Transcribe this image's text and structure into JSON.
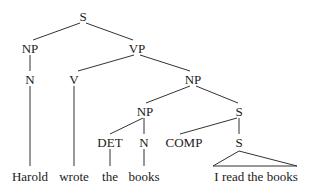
{
  "diagram": {
    "type": "syntax-tree",
    "nodes": [
      {
        "id": "s_root",
        "label": "S",
        "x": 83,
        "y": 17
      },
      {
        "id": "np1",
        "label": "NP",
        "x": 30,
        "y": 49
      },
      {
        "id": "vp",
        "label": "VP",
        "x": 137,
        "y": 49
      },
      {
        "id": "n1",
        "label": "N",
        "x": 30,
        "y": 80
      },
      {
        "id": "v",
        "label": "V",
        "x": 74,
        "y": 80
      },
      {
        "id": "np2",
        "label": "NP",
        "x": 193,
        "y": 80
      },
      {
        "id": "np3",
        "label": "NP",
        "x": 145,
        "y": 112
      },
      {
        "id": "s2",
        "label": "S",
        "x": 239,
        "y": 112
      },
      {
        "id": "det",
        "label": "DET",
        "x": 110,
        "y": 143
      },
      {
        "id": "n2",
        "label": "N",
        "x": 144,
        "y": 143
      },
      {
        "id": "comp",
        "label": "COMP",
        "x": 196,
        "y": 143
      },
      {
        "id": "s3",
        "label": "S",
        "x": 239,
        "y": 143
      }
    ],
    "leaves": [
      {
        "id": "w_harold",
        "label": "Harold",
        "x": 30,
        "y": 178
      },
      {
        "id": "w_wrote",
        "label": "wrote",
        "x": 74,
        "y": 178
      },
      {
        "id": "w_the",
        "label": "the",
        "x": 110,
        "y": 178
      },
      {
        "id": "w_books",
        "label": "books",
        "x": 144,
        "y": 178
      },
      {
        "id": "w_clause",
        "label": "I read the books",
        "x": 256,
        "y": 178
      }
    ],
    "edges": [
      [
        "s_root",
        "np1"
      ],
      [
        "s_root",
        "vp"
      ],
      [
        "np1",
        "n1"
      ],
      [
        "vp",
        "v"
      ],
      [
        "vp",
        "np2"
      ],
      [
        "np2",
        "np3"
      ],
      [
        "np2",
        "s2"
      ],
      [
        "np3",
        "det"
      ],
      [
        "np3",
        "n2"
      ],
      [
        "s2",
        "comp"
      ],
      [
        "s2",
        "s3"
      ],
      [
        "n1",
        "w_harold"
      ],
      [
        "v",
        "w_wrote"
      ],
      [
        "det",
        "w_the"
      ],
      [
        "n2",
        "w_books"
      ]
    ],
    "triangle": {
      "from": "s3",
      "apex": [
        239,
        151
      ],
      "base_left": [
        213,
        166
      ],
      "base_right": [
        297,
        166
      ],
      "leaf": "w_clause"
    }
  }
}
